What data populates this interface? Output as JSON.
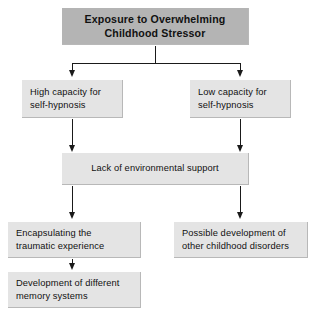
{
  "diagram": {
    "background_color": "#ffffff",
    "title_node_color": "#b4b4b4",
    "node_color": "#e4e4e4",
    "line_color": "#1a1a1a",
    "nodes": [
      {
        "id": "root",
        "label": "Exposure to Overwhelming\nChildhood Stressor"
      },
      {
        "id": "high_capacity",
        "label": "High capacity for\nself-hypnosis"
      },
      {
        "id": "low_capacity",
        "label": "Low capacity for\nself-hypnosis"
      },
      {
        "id": "lack_support",
        "label": "Lack of environmental support"
      },
      {
        "id": "encapsulating",
        "label": "Encapsulating the\ntraumatic experience"
      },
      {
        "id": "possible_development",
        "label": "Possible development of\nother childhood disorders"
      },
      {
        "id": "memory_systems",
        "label": "Development of different\nmemory systems"
      }
    ]
  }
}
